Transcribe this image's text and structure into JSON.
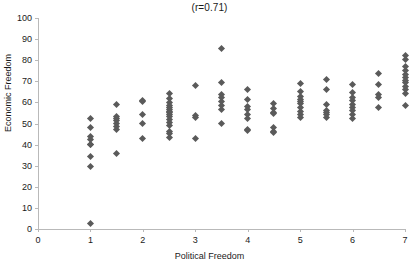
{
  "chart_data": {
    "type": "scatter",
    "title": "(r=0.71)",
    "xlabel": "Political Freedom",
    "ylabel": "Economic Freedom",
    "xlim": [
      0,
      7
    ],
    "ylim": [
      0,
      100
    ],
    "xticks": [
      0,
      1,
      2,
      3,
      4,
      5,
      6,
      7
    ],
    "yticks": [
      0,
      10,
      20,
      30,
      40,
      50,
      60,
      70,
      80,
      90,
      100
    ],
    "grid": false,
    "legend": null,
    "correlation": 0.71,
    "marker": {
      "shape": "diamond",
      "color": "#5a5a5a",
      "size": 5
    },
    "series": [
      {
        "name": "countries",
        "points": [
          [
            1,
            52.4
          ],
          [
            1,
            48.0
          ],
          [
            1,
            44.0
          ],
          [
            1,
            42.3
          ],
          [
            1,
            40.2
          ],
          [
            1,
            40.0
          ],
          [
            1,
            34.5
          ],
          [
            1,
            29.8
          ],
          [
            1,
            2.8
          ],
          [
            1.5,
            59.2
          ],
          [
            1.5,
            53.5
          ],
          [
            1.5,
            52.6
          ],
          [
            1.5,
            51.6
          ],
          [
            1.5,
            50.0
          ],
          [
            1.5,
            48.4
          ],
          [
            1.5,
            47.1
          ],
          [
            1.5,
            35.6
          ],
          [
            2,
            61.0
          ],
          [
            2,
            60.6
          ],
          [
            2,
            54.4
          ],
          [
            2,
            49.9
          ],
          [
            2,
            43.0
          ],
          [
            2.5,
            64.0
          ],
          [
            2.5,
            62.0
          ],
          [
            2.5,
            60.0
          ],
          [
            2.5,
            58.6
          ],
          [
            2.5,
            57.4
          ],
          [
            2.5,
            56.4
          ],
          [
            2.5,
            55.6
          ],
          [
            2.5,
            55.0
          ],
          [
            2.5,
            54.2
          ],
          [
            2.5,
            53.4
          ],
          [
            2.5,
            52.0
          ],
          [
            2.5,
            50.3
          ],
          [
            2.5,
            49.2
          ],
          [
            2.5,
            46.2
          ],
          [
            2.5,
            45.2
          ],
          [
            2.5,
            43.4
          ],
          [
            3,
            68.2
          ],
          [
            3,
            54.0
          ],
          [
            3,
            53.0
          ],
          [
            3,
            43.0
          ],
          [
            3.5,
            85.4
          ],
          [
            3.5,
            69.4
          ],
          [
            3.5,
            63.8
          ],
          [
            3.5,
            62.2
          ],
          [
            3.5,
            60.4
          ],
          [
            3.5,
            58.6
          ],
          [
            3.5,
            56.6
          ],
          [
            3.5,
            50.2
          ],
          [
            4,
            66.0
          ],
          [
            4,
            61.4
          ],
          [
            4,
            58.0
          ],
          [
            4,
            56.4
          ],
          [
            4,
            54.4
          ],
          [
            4,
            52.4
          ],
          [
            4,
            47.2
          ],
          [
            4,
            46.8
          ],
          [
            4.5,
            59.4
          ],
          [
            4.5,
            57.0
          ],
          [
            4.5,
            55.2
          ],
          [
            4.5,
            54.6
          ],
          [
            4.5,
            48.2
          ],
          [
            4.5,
            46.2
          ],
          [
            4.5,
            45.6
          ],
          [
            5,
            69.0
          ],
          [
            5,
            65.0
          ],
          [
            5,
            62.6
          ],
          [
            5,
            61.4
          ],
          [
            5,
            60.6
          ],
          [
            5,
            59.4
          ],
          [
            5,
            57.4
          ],
          [
            5,
            55.6
          ],
          [
            5,
            54.2
          ],
          [
            5,
            53.0
          ],
          [
            5.5,
            71.0
          ],
          [
            5.5,
            66.0
          ],
          [
            5.5,
            59.2
          ],
          [
            5.5,
            56.2
          ],
          [
            5.5,
            55.0
          ],
          [
            5.5,
            54.2
          ],
          [
            5.5,
            53.0
          ],
          [
            6,
            68.4
          ],
          [
            6,
            64.6
          ],
          [
            6,
            62.4
          ],
          [
            6,
            60.8
          ],
          [
            6,
            59.2
          ],
          [
            6,
            57.6
          ],
          [
            6,
            56.0
          ],
          [
            6,
            54.4
          ],
          [
            6,
            52.4
          ],
          [
            6.5,
            73.6
          ],
          [
            6.5,
            68.6
          ],
          [
            6.5,
            63.8
          ],
          [
            6.5,
            62.4
          ],
          [
            6.5,
            57.8
          ],
          [
            7,
            82.2
          ],
          [
            7,
            80.4
          ],
          [
            7,
            77.0
          ],
          [
            7,
            75.0
          ],
          [
            7,
            73.4
          ],
          [
            7,
            72.0
          ],
          [
            7,
            70.6
          ],
          [
            7,
            69.2
          ],
          [
            7,
            67.6
          ],
          [
            7,
            66.0
          ],
          [
            7,
            64.0
          ],
          [
            7,
            58.6
          ]
        ]
      }
    ]
  }
}
